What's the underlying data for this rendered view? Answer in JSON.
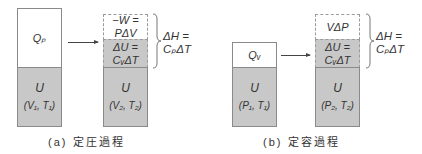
{
  "panel_a": {
    "caption": "(a) 定圧過程",
    "initial": {
      "heat": "Qₚ",
      "energy": "U",
      "state": "(V₁, T₁)"
    },
    "final": {
      "work_line1": "−W =",
      "work_line2": "PΔV",
      "du_line1": "ΔU =",
      "du_line2": "CᵥΔT",
      "energy": "U",
      "state": "(V₂, T₂)"
    },
    "enthalpy_line1": "ΔH =",
    "enthalpy_line2": "CₚΔT"
  },
  "panel_b": {
    "caption": "(b) 定容過程",
    "initial": {
      "heat": "Qᵥ",
      "energy": "U",
      "state": "(P₁, T₁)"
    },
    "final": {
      "work_line1": "VΔP",
      "du_line1": "ΔU =",
      "du_line2": "CᵥΔT",
      "energy": "U",
      "state": "(P₂, T₂)"
    },
    "enthalpy_line1": "ΔH =",
    "enthalpy_line2": "CₚΔT"
  },
  "colors": {
    "fill_gray": "#c8c8c8",
    "border": "#8a8a8a",
    "text": "#333333"
  }
}
